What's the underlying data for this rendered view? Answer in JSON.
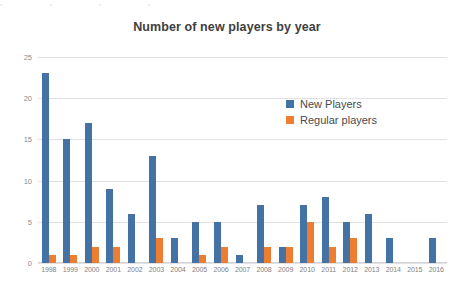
{
  "top_cutoff_text": [
    "•",
    "•",
    "•",
    "•"
  ],
  "chart_data": {
    "type": "bar",
    "title": "Number of new players by year",
    "xlabel": "",
    "ylabel": "",
    "ylim": [
      0,
      25
    ],
    "yticks": [
      0,
      5,
      10,
      15,
      20,
      25
    ],
    "grid": true,
    "legend_position": "inside-right",
    "categories": [
      "1998",
      "1999",
      "2000",
      "2001",
      "2002",
      "2003",
      "2004",
      "2005",
      "2006",
      "2007",
      "2008",
      "2009",
      "2010",
      "2011",
      "2012",
      "2013",
      "2014",
      "2015",
      "2016"
    ],
    "series": [
      {
        "name": "New Players",
        "color": "#4472a4",
        "values": [
          23,
          15,
          17,
          9,
          6,
          13,
          3,
          5,
          5,
          1,
          7,
          2,
          7,
          8,
          5,
          6,
          3,
          0,
          3
        ]
      },
      {
        "name": "Regular players",
        "color": "#ed7d31",
        "values": [
          1,
          1,
          2,
          2,
          0,
          3,
          0,
          1,
          2,
          0,
          2,
          2,
          5,
          2,
          3,
          0,
          0,
          0,
          0
        ]
      }
    ]
  }
}
